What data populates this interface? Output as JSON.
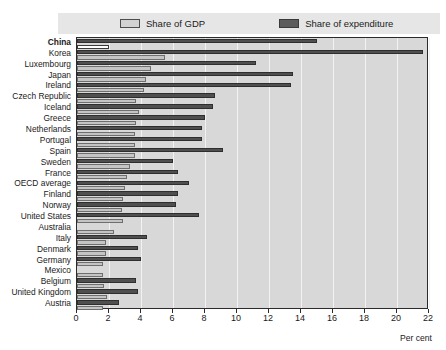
{
  "legend": {
    "gdp_label": "Share of GDP",
    "expenditure_label": "Share of expenditure"
  },
  "axis": {
    "unit_label": "Per cent",
    "ticks": [
      "0",
      "2",
      "4",
      "6",
      "8",
      "10",
      "12",
      "14",
      "16",
      "18",
      "20",
      "22"
    ]
  },
  "colors": {
    "plot_background": "#d8d8d8",
    "gridline": "#f2f2f2",
    "legend_background": "#e6e6e6",
    "gdp_bar": "#c4c4c4",
    "expenditure_bar": "#4f4f4f",
    "frame": "#2b2b2b"
  },
  "chart_data": {
    "type": "bar",
    "orientation": "horizontal",
    "title": "",
    "xlabel": "Per cent",
    "ylabel": "",
    "xlim": [
      0,
      22
    ],
    "xticks": [
      0,
      2,
      4,
      6,
      8,
      10,
      12,
      14,
      16,
      18,
      20,
      22
    ],
    "grid": true,
    "legend_position": "top",
    "categories": [
      "China",
      "Korea",
      "Luxembourg",
      "Japan",
      "Ireland",
      "Czech Republic",
      "Iceland",
      "Greece",
      "Netherlands",
      "Portugal",
      "Spain",
      "Sweden",
      "France",
      "OECD average",
      "Finland",
      "Norway",
      "United States",
      "Australia",
      "Italy",
      "Denmark",
      "Germany",
      "Mexico",
      "Belgium",
      "United Kingdom",
      "Austria"
    ],
    "series": [
      {
        "name": "Share of expenditure",
        "values": [
          15.0,
          21.6,
          11.2,
          13.5,
          13.4,
          8.6,
          8.5,
          8.0,
          7.8,
          7.8,
          9.1,
          6.0,
          6.3,
          7.0,
          6.3,
          6.2,
          7.6,
          0.0,
          4.4,
          3.8,
          4.0,
          0.0,
          3.7,
          3.8,
          2.6
        ]
      },
      {
        "name": "Share of GDP",
        "values": [
          2.0,
          5.5,
          4.6,
          4.3,
          4.2,
          3.7,
          3.9,
          3.7,
          3.6,
          3.6,
          3.6,
          3.3,
          3.1,
          3.0,
          2.9,
          2.8,
          2.9,
          2.3,
          1.8,
          1.8,
          1.6,
          1.6,
          1.7,
          1.9,
          1.6
        ]
      }
    ],
    "notes": {
      "China_gdp_bar_style": "hollow"
    }
  },
  "labels": {
    "emphasized_category": "China"
  }
}
